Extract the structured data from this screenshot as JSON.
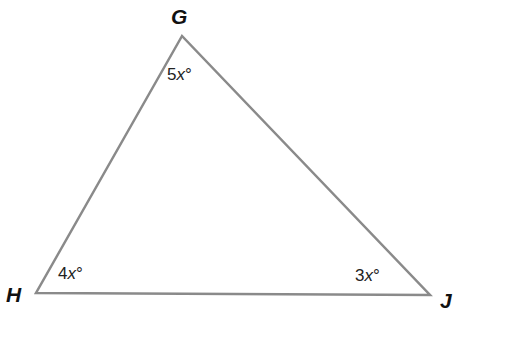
{
  "diagram": {
    "type": "triangle",
    "stroke_color": "#8a8a8a",
    "vertices": [
      {
        "label": "G",
        "x": 182,
        "y": 36
      },
      {
        "label": "H",
        "x": 36,
        "y": 293
      },
      {
        "label": "J",
        "x": 430,
        "y": 295
      }
    ],
    "angles": {
      "G": {
        "coef": "5",
        "var": "x",
        "unit": "°"
      },
      "H": {
        "coef": "4",
        "var": "x",
        "unit": "°"
      },
      "J": {
        "coef": "3",
        "var": "x",
        "unit": "°"
      }
    }
  }
}
